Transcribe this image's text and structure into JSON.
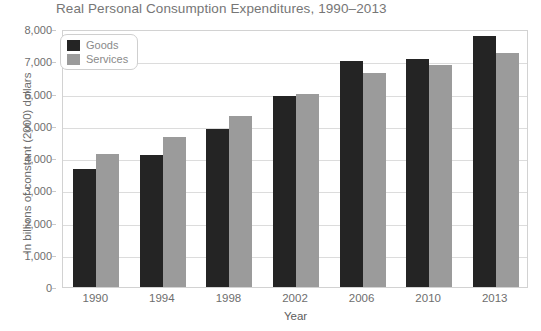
{
  "chart_data": {
    "type": "bar",
    "title": "Real Personal Consumption Expenditures, 1990–2013",
    "xlabel": "Year",
    "ylabel": "In billions of constant (2000) dollars",
    "categories": [
      "1990",
      "1994",
      "1998",
      "2002",
      "2006",
      "2010",
      "2013"
    ],
    "series": [
      {
        "name": "Goods",
        "color": "#242424",
        "values": [
          3650,
          4080,
          4900,
          5930,
          7000,
          7060,
          7780
        ]
      },
      {
        "name": "Services",
        "color": "#9b9b9b",
        "values": [
          4120,
          4640,
          5290,
          5970,
          6640,
          6870,
          7260
        ]
      }
    ],
    "ylim": [
      0,
      8000
    ],
    "yticks": [
      0,
      1000,
      2000,
      3000,
      4000,
      5000,
      6000,
      7000,
      8000
    ],
    "ytick_labels": [
      "0",
      "1,000",
      "2,000",
      "3,000",
      "4,000",
      "5,000",
      "6,000",
      "7,000",
      "8,000"
    ],
    "grid": true,
    "legend_position": "top-left"
  },
  "legend": {
    "items": [
      {
        "label": "Goods",
        "swatch": "goods-swatch"
      },
      {
        "label": "Services",
        "swatch": "services-swatch"
      }
    ]
  }
}
